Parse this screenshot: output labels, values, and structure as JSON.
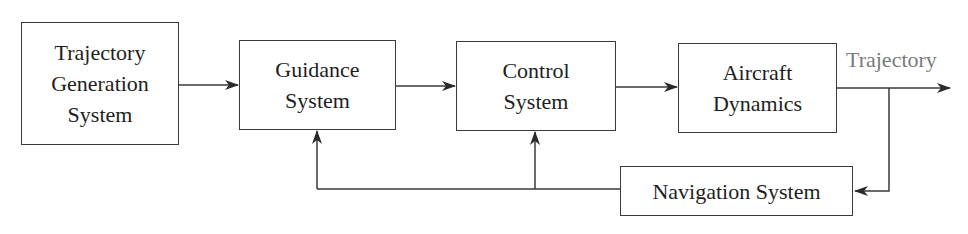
{
  "diagram": {
    "type": "block-diagram",
    "blocks": [
      {
        "id": "trajectory-generation",
        "label": "Trajectory\nGeneration\nSystem"
      },
      {
        "id": "guidance",
        "label": "Guidance\nSystem"
      },
      {
        "id": "control",
        "label": "Control\nSystem"
      },
      {
        "id": "aircraft-dynamics",
        "label": "Aircraft\nDynamics"
      },
      {
        "id": "navigation",
        "label": "Navigation System"
      }
    ],
    "output_label": "Trajectory",
    "connections": [
      {
        "from": "trajectory-generation",
        "to": "guidance"
      },
      {
        "from": "guidance",
        "to": "control"
      },
      {
        "from": "control",
        "to": "aircraft-dynamics"
      },
      {
        "from": "aircraft-dynamics",
        "to": "output",
        "label": "Trajectory"
      },
      {
        "from": "aircraft-dynamics",
        "to": "navigation",
        "type": "feedback"
      },
      {
        "from": "navigation",
        "to": "guidance",
        "type": "feedback"
      },
      {
        "from": "navigation",
        "to": "control",
        "type": "feedback"
      }
    ],
    "colors": {
      "line": "#3a3a3a",
      "text": "#1e1e1e",
      "output_label": "#7a7a7a"
    }
  }
}
